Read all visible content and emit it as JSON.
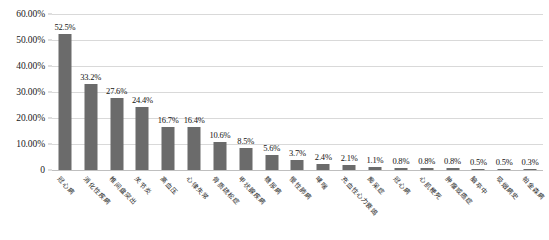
{
  "chart_data": {
    "type": "bar",
    "title": "",
    "xlabel": "",
    "ylabel": "",
    "ylim": [
      0,
      60
    ],
    "grid": true,
    "legend": "none",
    "orientation": "vertical",
    "bar_color": "#6B6B6B",
    "gridline_color": "#D9D9D9",
    "background_color": "#FFFFFF",
    "y_ticks": [
      "0",
      "10.00%",
      "20.00%",
      "30.00%",
      "40.00%",
      "50.00%",
      "60.00%"
    ],
    "y_tick_values": [
      0,
      10,
      20,
      30,
      40,
      50,
      60
    ],
    "categories": [
      "冠心病",
      "消化性疾病",
      "椎间盘突出",
      "关节炎",
      "高血压",
      "心律失常",
      "骨质疏松症",
      "甲状腺疾病",
      "糖尿病",
      "慢性肺病",
      "哮喘",
      "充血性心力衰竭",
      "痴呆症",
      "冠心病",
      "心肌梗死",
      "肿瘤或癌症",
      "脑卒中",
      "吸烟病史",
      "帕金森病"
    ],
    "values": [
      52.5,
      33.2,
      27.6,
      24.4,
      16.7,
      16.4,
      10.6,
      8.5,
      5.6,
      3.7,
      2.4,
      2.1,
      1.1,
      0.8,
      0.8,
      0.8,
      0.5,
      0.5,
      0.3
    ],
    "value_labels": [
      "52.5%",
      "33.2%",
      "27.6%",
      "24.4%",
      "16.7%",
      "16.4%",
      "10.6%",
      "8.5%",
      "5.6%",
      "3.7%",
      "2.4%",
      "2.1%",
      "1.1%",
      "0.8%",
      "0.8%",
      "0.8%",
      "0.5%",
      "0.5%",
      "0.3%"
    ]
  }
}
